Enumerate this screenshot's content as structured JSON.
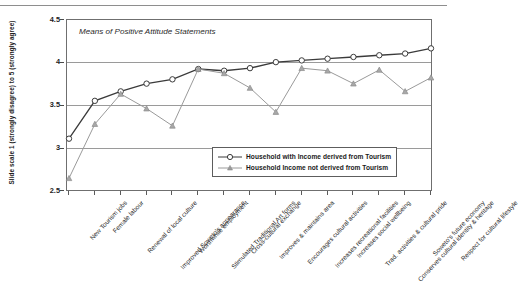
{
  "chart_data": {
    "type": "line",
    "title": "Means of Positive Attitude Statements",
    "xlabel": "",
    "ylabel": "Slide scale 1 (strongly disagree) to 5 (strongly agree)",
    "ylim": [
      2.5,
      4.5
    ],
    "yticks": [
      "2.5",
      "3",
      "3.5",
      "4",
      "4.5"
    ],
    "ytick_values": [
      2.5,
      3,
      3.5,
      4,
      4.5
    ],
    "grid": true,
    "legend_position": "bottom-right",
    "categories": [
      "New Tourism jobs",
      "Female labour",
      "Renewal of local culture",
      "Improved Soweto's appearance",
      "Worthwhile employment",
      "Stimulated Traditional Art forms",
      "Cross-cultural exchange",
      "Improves & maintains area",
      "Encourages cultural activities",
      "Increases recreational facilities",
      "Increases social wellbeing",
      "Trad. activities & cultural pride",
      "Conserves cultural identity & heritage",
      "Soweto's future economy",
      "Respect for cultural lifestyle"
    ],
    "series": [
      {
        "name": "Household with Income derived from Tourism",
        "marker": "circle",
        "color": "#3b3b3b",
        "values": [
          3.12,
          3.56,
          3.67,
          3.76,
          3.81,
          3.93,
          3.91,
          3.94,
          4.01,
          4.03,
          4.05,
          4.07,
          4.09,
          4.11,
          4.17
        ]
      },
      {
        "name": "Household Income not derived from Tourism",
        "marker": "triangle",
        "color": "#9a9a9a",
        "values": [
          2.66,
          3.29,
          3.64,
          3.47,
          3.27,
          3.93,
          3.88,
          3.71,
          3.43,
          3.94,
          3.91,
          3.76,
          3.92,
          3.67,
          3.83
        ]
      }
    ]
  },
  "legend": {
    "entries": [
      "Household with Income derived from Tourism",
      "Household Income not derived from Tourism"
    ]
  }
}
